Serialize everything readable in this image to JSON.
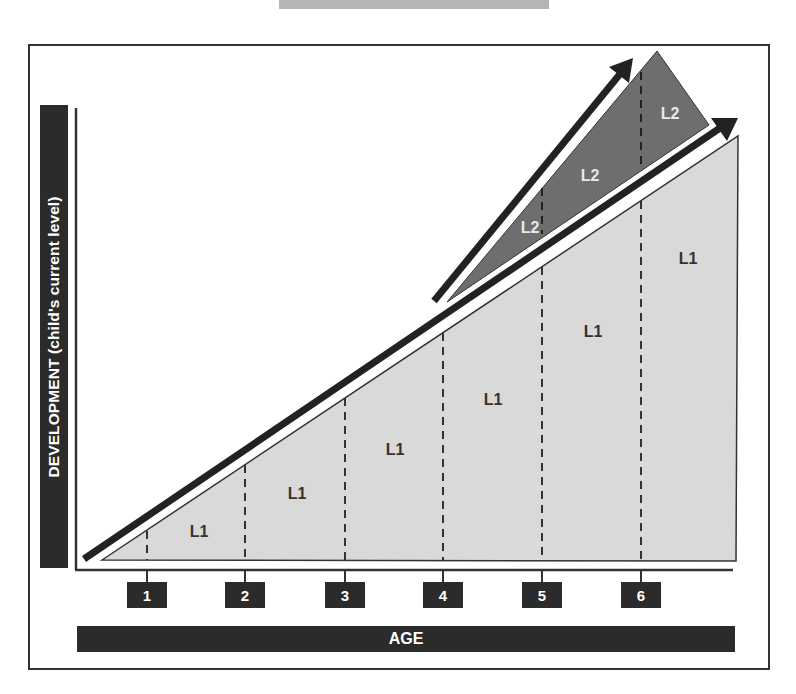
{
  "diagram": {
    "y_axis_label": "DEVELOPMENT (child's current level)",
    "x_axis_label": "AGE",
    "ages": [
      "1",
      "2",
      "3",
      "4",
      "5",
      "6"
    ],
    "colors": {
      "frame": "#333333",
      "dark_fill": "#2b2b2b",
      "l1_fill": "#d9d9d9",
      "l2_fill": "#6e6e6e",
      "arrow": "#222222",
      "l1_text": "#333333",
      "l2_text": "#e8e8e8"
    },
    "regions": {
      "l1": [
        {
          "age_segment": "1-2",
          "label": "L1"
        },
        {
          "age_segment": "2-3",
          "label": "L1"
        },
        {
          "age_segment": "3-4",
          "label": "L1"
        },
        {
          "age_segment": "4-5",
          "label": "L1"
        },
        {
          "age_segment": "5-6",
          "label": "L1"
        },
        {
          "age_segment": "6+",
          "label": "L1"
        }
      ],
      "l2": [
        {
          "age_segment": "4-5",
          "label": "L2"
        },
        {
          "age_segment": "5-6",
          "label": "L2"
        },
        {
          "age_segment": "6+",
          "label": "L2"
        }
      ]
    },
    "arrows": [
      {
        "name": "L1 development trajectory",
        "from_age": "0",
        "to_age": "6+"
      },
      {
        "name": "L2 development trajectory",
        "from_age": "4",
        "to_age": "6"
      }
    ]
  }
}
